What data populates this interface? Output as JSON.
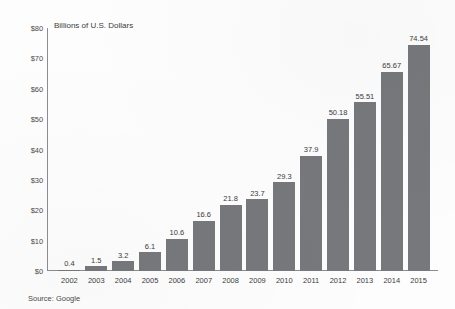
{
  "chart_data": {
    "type": "bar",
    "title": "",
    "axis_title": "Billions of U.S. Dollars",
    "xlabel": "",
    "ylabel": "Billions of U.S. Dollars",
    "ylim": [
      0,
      80
    ],
    "grid": false,
    "legend": "none",
    "bar_color": "#77787b",
    "axis_color": "#8d8d8d",
    "categories": [
      "2002",
      "2003",
      "2004",
      "2005",
      "2006",
      "2007",
      "2008",
      "2009",
      "2010",
      "2011",
      "2012",
      "2013",
      "2014",
      "2015"
    ],
    "values": [
      0.4,
      1.5,
      3.2,
      6.1,
      10.6,
      16.6,
      21.8,
      23.7,
      29.3,
      37.9,
      50.18,
      55.51,
      65.67,
      74.54
    ],
    "value_labels": [
      "0.4",
      "1.5",
      "3.2",
      "6.1",
      "10.6",
      "16.6",
      "21.8",
      "23.7",
      "29.3",
      "37.9",
      "50.18",
      "55.51",
      "65.67",
      "74.54"
    ],
    "y_ticks": [
      0,
      10,
      20,
      30,
      40,
      50,
      60,
      70,
      80
    ],
    "y_tick_labels": [
      "$0",
      "$10",
      "$20",
      "$30",
      "$40",
      "$50",
      "$60",
      "$70",
      "$80"
    ],
    "source": "Source: Google"
  }
}
